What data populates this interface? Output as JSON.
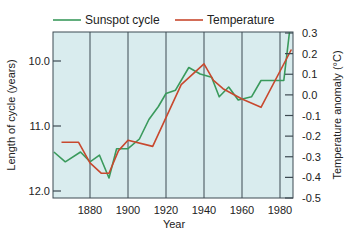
{
  "chart_data": {
    "type": "line",
    "title": "",
    "xlabel": "Year",
    "ylabel_left": "Length of cycle (years)",
    "ylabel_right": "Temperature anomaly (°C)",
    "xlim": [
      1860,
      1987
    ],
    "ylim_left": [
      9.55,
      12.1
    ],
    "left_axis_inverted": true,
    "ylim_right": [
      -0.5,
      0.3
    ],
    "x_ticks": [
      1880,
      1900,
      1920,
      1940,
      1960,
      1980
    ],
    "x_tick_labels": [
      "1880",
      "1900",
      "1920",
      "1940",
      "1960",
      "1980"
    ],
    "left_ticks": [
      10.0,
      11.0,
      12.0
    ],
    "left_tick_labels": [
      "10.0",
      "11.0",
      "12.0"
    ],
    "right_ticks": [
      0.3,
      0.2,
      0.1,
      0.0,
      -0.1,
      -0.2,
      -0.3,
      -0.4,
      -0.5
    ],
    "right_tick_labels": [
      "0.3",
      "0.2",
      "0.1",
      "0.0",
      "-0.1",
      "-0.2",
      "-0.3",
      "-0.4",
      "-0.5"
    ],
    "grid": "vertical lines at x ticks",
    "legend_position": "top",
    "background": "#d9ecee",
    "series": [
      {
        "name": "Sunspot cycle",
        "axis": "left",
        "color": "#3a9a5c",
        "x": [
          1861,
          1867,
          1875,
          1880,
          1885,
          1890,
          1894,
          1900,
          1906,
          1911,
          1916,
          1920,
          1925,
          1932,
          1938,
          1944,
          1948,
          1953,
          1958,
          1965,
          1970,
          1977,
          1982,
          1985
        ],
        "values": [
          11.4,
          11.55,
          11.4,
          11.55,
          11.45,
          11.8,
          11.35,
          11.35,
          11.2,
          10.9,
          10.7,
          10.5,
          10.45,
          10.1,
          10.2,
          10.25,
          10.55,
          10.4,
          10.6,
          10.55,
          10.3,
          10.3,
          10.3,
          9.55
        ]
      },
      {
        "name": "Temperature",
        "axis": "right",
        "color": "#c8482e",
        "x": [
          1865,
          1874,
          1880,
          1886,
          1890,
          1895,
          1900,
          1913,
          1928,
          1940,
          1945,
          1950,
          1960,
          1970,
          1986
        ],
        "values": [
          -0.23,
          -0.23,
          -0.33,
          -0.38,
          -0.38,
          -0.27,
          -0.22,
          -0.25,
          0.05,
          0.15,
          0.07,
          0.03,
          -0.02,
          -0.06,
          0.22
        ]
      }
    ]
  },
  "legend": {
    "items": [
      {
        "label": "Sunspot cycle",
        "color": "#3a9a5c"
      },
      {
        "label": "Temperature",
        "color": "#c8482e"
      }
    ]
  },
  "axes": {
    "x_title": "Year",
    "left_title": "Length of cycle (years)",
    "right_title": "Temperature anomaly (°C)"
  },
  "colors": {
    "plot_bg": "#d9ecee",
    "grid": "#3d4a52",
    "axis": "#3d4a52"
  }
}
